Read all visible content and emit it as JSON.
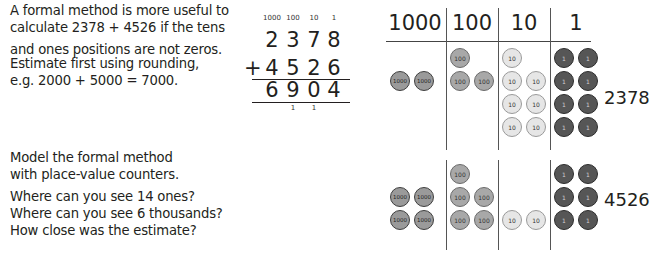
{
  "left_text": {
    "intro": [
      "A formal method is more useful to",
      "calculate 2378 + 4526 if the tens",
      "and ones positions are not zeros."
    ],
    "estimate": [
      "Estimate first using rounding,",
      "e.g. 2000 + 5000 = 7000."
    ],
    "model": [
      "Model the formal method",
      "with place-value counters."
    ],
    "questions": [
      "Where can you see 14 ones?",
      "Where can you see 6 thousands?",
      "How close was the estimate?"
    ]
  },
  "calculation": {
    "headers": [
      "1000",
      "100",
      "10",
      "1"
    ],
    "addend1": [
      "2",
      "3",
      "7",
      "8"
    ],
    "operator": "+",
    "addend2": [
      "4",
      "5",
      "2",
      "6"
    ],
    "sum": [
      "6",
      "9",
      "0",
      "4"
    ],
    "carries": [
      "",
      "1",
      "1",
      ""
    ]
  },
  "place_value_chart": {
    "columns": [
      "1000",
      "100",
      "10",
      "1"
    ],
    "rows": [
      {
        "number": "2378",
        "counts": {
          "1000": 2,
          "100": 3,
          "10": 7,
          "1": 8
        }
      },
      {
        "number": "4526",
        "counts": {
          "1000": 4,
          "100": 5,
          "10": 2,
          "1": 6
        }
      }
    ],
    "counter_labels": {
      "1000": "1000",
      "100": "100",
      "10": "10",
      "1": "1"
    }
  }
}
